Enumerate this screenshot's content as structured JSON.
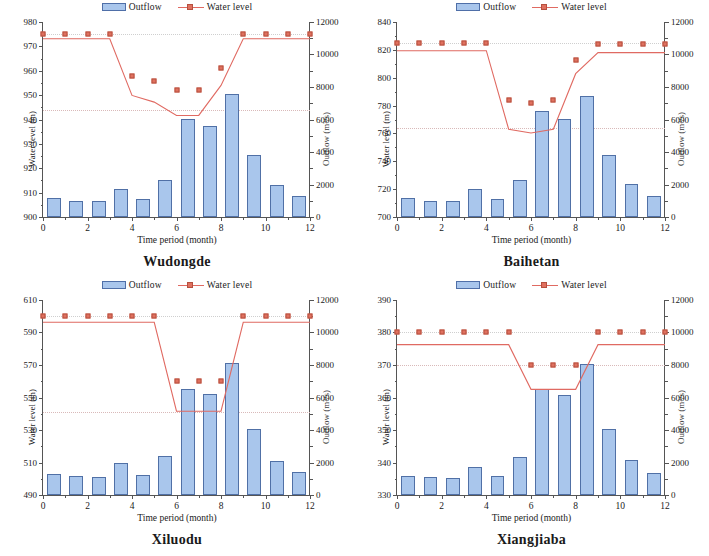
{
  "figure": {
    "background": "#ffffff",
    "bar_fill": "#a9c6ec",
    "bar_edge": "#5070a6",
    "line_color": "#e06a62",
    "marker_fill": "#e0705f",
    "marker_edge": "#b5503f"
  },
  "legend": {
    "bar_label": "Outflow",
    "line_label": "Water level"
  },
  "axis_titles": {
    "left": "Water level (m)",
    "right": "Outflow (m³/s)",
    "x": "Time  period (month)"
  },
  "charts": [
    {
      "id": "wudongde",
      "title": "Wudongde",
      "chart_data": {
        "type": "bar",
        "title": "Wudongde",
        "xlabel": "Time  period (month)",
        "ylabel": "Water level (m)",
        "y2label": "Outflow (m³/s)",
        "grid": false,
        "legend_position": "top-center",
        "xlim": [
          0,
          12
        ],
        "xticks": [
          0,
          2,
          4,
          6,
          8,
          10,
          12
        ],
        "xtick_labels": [
          "0",
          "2",
          "4",
          "6",
          "8",
          "10",
          "12"
        ],
        "ylim": [
          900,
          980
        ],
        "yticks": [
          900,
          910,
          920,
          930,
          940,
          950,
          960,
          970,
          980
        ],
        "ytick_labels": [
          "900",
          "910",
          "920",
          "930",
          "940",
          "950",
          "960",
          "970",
          "980"
        ],
        "y2lim": [
          0,
          12000
        ],
        "y2ticks": [
          0,
          2000,
          4000,
          6000,
          8000,
          10000,
          12000
        ],
        "y2tick_labels": [
          "0",
          "2000",
          "4000",
          "6000",
          "8000",
          "10000",
          "12000"
        ],
        "reference_line_y": 944,
        "categories": [
          1,
          2,
          3,
          4,
          5,
          6,
          7,
          8,
          9,
          10,
          11,
          12
        ],
        "series": [
          {
            "name": "Outflow",
            "type": "bar",
            "axis": "right",
            "units": "m³/s",
            "values": [
              1190,
              1000,
              980,
              1700,
              1100,
              2300,
              6050,
              5600,
              7550,
              3800,
              2000,
              1280
            ]
          },
          {
            "name": "Water level",
            "type": "line",
            "axis": "left",
            "units": "m",
            "x": [
              0,
              1,
              2,
              3,
              4,
              5,
              6,
              7,
              8,
              9,
              10,
              11,
              12
            ],
            "values": [
              975,
              975,
              975,
              975,
              958,
              956,
              952,
              952,
              961,
              975,
              975,
              975,
              975
            ]
          }
        ]
      }
    },
    {
      "id": "baihetan",
      "title": "Baihetan",
      "chart_data": {
        "type": "bar",
        "title": "Baihetan",
        "xlabel": "Time  period (month)",
        "ylabel": "Water level (m)",
        "y2label": "Outflow (m³/s)",
        "grid": false,
        "legend_position": "top-center",
        "xlim": [
          0,
          12
        ],
        "xticks": [
          0,
          2,
          4,
          6,
          8,
          10,
          12
        ],
        "xtick_labels": [
          "0",
          "2",
          "4",
          "6",
          "8",
          "10",
          "12"
        ],
        "ylim": [
          700,
          840
        ],
        "yticks": [
          700,
          720,
          740,
          760,
          780,
          800,
          820,
          840
        ],
        "ytick_labels": [
          "700",
          "720",
          "740",
          "760",
          "780",
          "800",
          "820",
          "840"
        ],
        "y2lim": [
          0,
          12000
        ],
        "y2ticks": [
          0,
          2000,
          4000,
          6000,
          8000,
          10000,
          12000
        ],
        "y2tick_labels": [
          "0",
          "2000",
          "4000",
          "6000",
          "8000",
          "10000",
          "12000"
        ],
        "reference_line_y": 764,
        "categories": [
          1,
          2,
          3,
          4,
          5,
          6,
          7,
          8,
          9,
          10,
          11,
          12
        ],
        "series": [
          {
            "name": "Outflow",
            "type": "bar",
            "axis": "right",
            "units": "m³/s",
            "values": [
              1150,
              1000,
              980,
              1700,
              1100,
              2250,
              6550,
              6050,
              7450,
              3800,
              2050,
              1300
            ]
          },
          {
            "name": "Water level",
            "type": "line",
            "axis": "left",
            "units": "m",
            "x": [
              0,
              1,
              2,
              3,
              4,
              5,
              6,
              7,
              8,
              9,
              10,
              11,
              12
            ],
            "values": [
              825,
              825,
              825,
              825,
              825,
              784,
              782,
              784,
              813,
              824,
              824,
              824,
              824
            ]
          }
        ]
      }
    },
    {
      "id": "xiluodu",
      "title": "Xiluodu",
      "chart_data": {
        "type": "bar",
        "title": "Xiluodu",
        "xlabel": "Time  period (month)",
        "ylabel": "Water level (m)",
        "y2label": "Outflow (m³/s)",
        "grid": false,
        "legend_position": "top-center",
        "xlim": [
          0,
          12
        ],
        "xticks": [
          0,
          2,
          4,
          6,
          8,
          10,
          12
        ],
        "xtick_labels": [
          "0",
          "2",
          "4",
          "6",
          "8",
          "10",
          "12"
        ],
        "ylim": [
          490,
          610
        ],
        "yticks": [
          490,
          510,
          530,
          550,
          570,
          590,
          610
        ],
        "ytick_labels": [
          "490",
          "510",
          "530",
          "550",
          "570",
          "590",
          "610"
        ],
        "y2lim": [
          0,
          12000
        ],
        "y2ticks": [
          0,
          2000,
          4000,
          6000,
          8000,
          10000,
          12000
        ],
        "y2tick_labels": [
          "0",
          "2000",
          "4000",
          "6000",
          "8000",
          "10000",
          "12000"
        ],
        "reference_line_y": 541,
        "categories": [
          1,
          2,
          3,
          4,
          5,
          6,
          7,
          8,
          9,
          10,
          11,
          12
        ],
        "series": [
          {
            "name": "Outflow",
            "type": "bar",
            "axis": "right",
            "units": "m³/s",
            "values": [
              1280,
              1180,
              1120,
              1950,
              1250,
              2400,
              6500,
              6200,
              8100,
              4050,
              2100,
              1400
            ]
          },
          {
            "name": "Water level",
            "type": "line",
            "axis": "left",
            "units": "m",
            "x": [
              0,
              1,
              2,
              3,
              4,
              5,
              6,
              7,
              8,
              9,
              10,
              11,
              12
            ],
            "values": [
              600,
              600,
              600,
              600,
              600,
              600,
              560,
              560,
              560,
              600,
              600,
              600,
              600
            ]
          }
        ]
      }
    },
    {
      "id": "xiangjiaba",
      "title": "Xiangjiaba",
      "chart_data": {
        "type": "bar",
        "title": "Xiangjiaba",
        "xlabel": "Time  period (month)",
        "ylabel": "Water level (m)",
        "y2label": "Outflow (m³/s)",
        "grid": false,
        "legend_position": "top-center",
        "xlim": [
          0,
          12
        ],
        "xticks": [
          0,
          2,
          4,
          6,
          8,
          10,
          12
        ],
        "xtick_labels": [
          "0",
          "2",
          "4",
          "6",
          "8",
          "10",
          "12"
        ],
        "ylim": [
          330,
          390
        ],
        "yticks": [
          330,
          340,
          350,
          360,
          370,
          380,
          390
        ],
        "ytick_labels": [
          "330",
          "340",
          "350",
          "360",
          "370",
          "380",
          "390"
        ],
        "y2lim": [
          0,
          12000
        ],
        "y2ticks": [
          0,
          2000,
          4000,
          6000,
          8000,
          10000,
          12000
        ],
        "y2tick_labels": [
          "0",
          "2000",
          "4000",
          "6000",
          "8000",
          "10000",
          "12000"
        ],
        "reference_line_y": 370,
        "categories": [
          1,
          2,
          3,
          4,
          5,
          6,
          7,
          8,
          9,
          10,
          11,
          12
        ],
        "series": [
          {
            "name": "Outflow",
            "type": "bar",
            "axis": "right",
            "units": "m³/s",
            "values": [
              1200,
              1080,
              1050,
              1750,
              1150,
              2350,
              6500,
              6150,
              8050,
              4050,
              2150,
              1350
            ]
          },
          {
            "name": "Water level",
            "type": "line",
            "axis": "left",
            "units": "m",
            "x": [
              0,
              1,
              2,
              3,
              4,
              5,
              6,
              7,
              8,
              9,
              10,
              11,
              12
            ],
            "values": [
              380,
              380,
              380,
              380,
              380,
              380,
              370,
              370,
              370,
              380,
              380,
              380,
              380
            ]
          }
        ]
      }
    }
  ]
}
